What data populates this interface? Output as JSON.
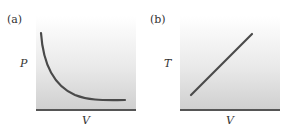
{
  "figure": {
    "panels": [
      {
        "id": "a",
        "label": "(a)",
        "ylabel": "P",
        "xlabel": "V",
        "curve": "hyperbola (P inversely proportional to V)"
      },
      {
        "id": "b",
        "label": "(b)",
        "ylabel": "T",
        "xlabel": "V",
        "curve": "straight line (T directly proportional to V)"
      }
    ],
    "colors": {
      "curve": "#4a4a4a",
      "axis": "#555555",
      "background_top": "#ffffff",
      "background_bottom": "#cfcfcf"
    }
  }
}
